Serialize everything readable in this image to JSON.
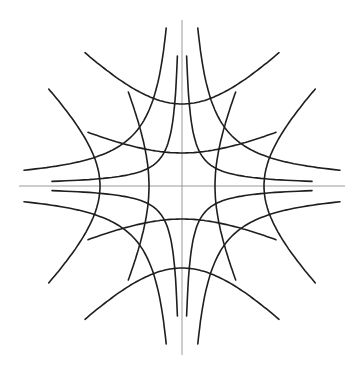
{
  "figure": {
    "center": [
      182,
      186
    ],
    "colors": {
      "curve": "#1e1e1e",
      "axis": "#9a9a9a",
      "background": "#ffffff"
    },
    "axes": {
      "horizontal": {
        "x1": 19,
        "x2": 345,
        "y": 186
      },
      "vertical": {
        "x": 182,
        "y1": 20,
        "y2": 355
      }
    },
    "vertical_opening_hyperbolas": [
      {
        "name": "inner",
        "a": 33,
        "half_width": 94
      },
      {
        "name": "outer",
        "a": 82,
        "half_width": 97
      }
    ],
    "horizontal_opening_hyperbolas": [
      {
        "name": "inner",
        "a": 33,
        "half_height": 94
      },
      {
        "name": "outer",
        "a": 82,
        "half_height": 97
      }
    ],
    "rectangular_hyperbolas_xy_k": [
      {
        "name": "inner",
        "k": 600,
        "min_dist": 5,
        "extent": 130
      },
      {
        "name": "outer",
        "k": 2500,
        "min_dist": 18,
        "extent": 158
      }
    ]
  }
}
